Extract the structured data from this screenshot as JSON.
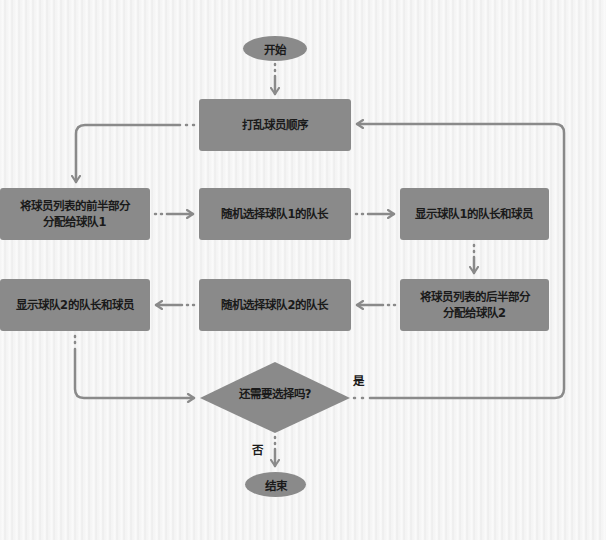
{
  "flowchart": {
    "start": "开始",
    "end": "结束",
    "nodes": {
      "shuffle": "打乱球员顺序",
      "assign_first_half_line1": "将球员列表的前半部分",
      "assign_first_half_line2": "分配给球队1",
      "pick_captain1": "随机选择球队1的队长",
      "show_team1": "显示球队1的队长和球员",
      "assign_second_half_line1": "将球员列表的后半部分",
      "assign_second_half_line2": "分配给球队2",
      "pick_captain2": "随机选择球队2的队长",
      "show_team2": "显示球队2的队长和球员"
    },
    "decision": {
      "question": "还需要选择吗?",
      "yes_label": "是",
      "no_label": "否"
    },
    "colors": {
      "node_fill": "#8a8a8a",
      "connector": "#8a8a8a",
      "text": "#1a1a1a"
    }
  }
}
